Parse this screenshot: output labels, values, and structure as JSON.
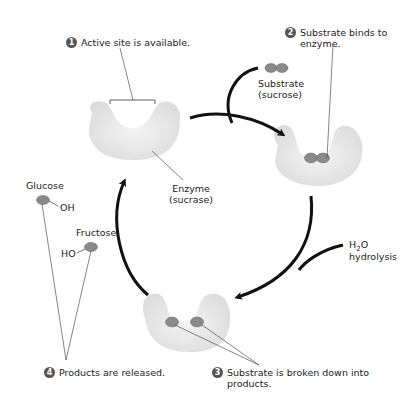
{
  "steps": [
    {
      "number": "1",
      "text": "Active site is available."
    },
    {
      "number": "2",
      "text": "Substrate binds to enzyme."
    },
    {
      "number": "3",
      "text": "Substrate is broken down into products."
    },
    {
      "number": "4",
      "text": "Products are released."
    }
  ],
  "labels": {
    "substrate": "Substrate",
    "substrate_name": "(sucrose)",
    "enzyme": "Enzyme",
    "enzyme_name": "(sucrase)",
    "glucose": "Glucose",
    "glucose_group": "OH",
    "fructose": "Fructose",
    "fructose_group": "HO",
    "water_h": "H",
    "water_sub": "2",
    "water_o": "O",
    "hydrolysis": "hydrolysis"
  },
  "colors": {
    "enzyme": "#e9e9e9",
    "molecule": "#8a8a8a",
    "arrow": "#111111",
    "step_badge": "#555555"
  }
}
